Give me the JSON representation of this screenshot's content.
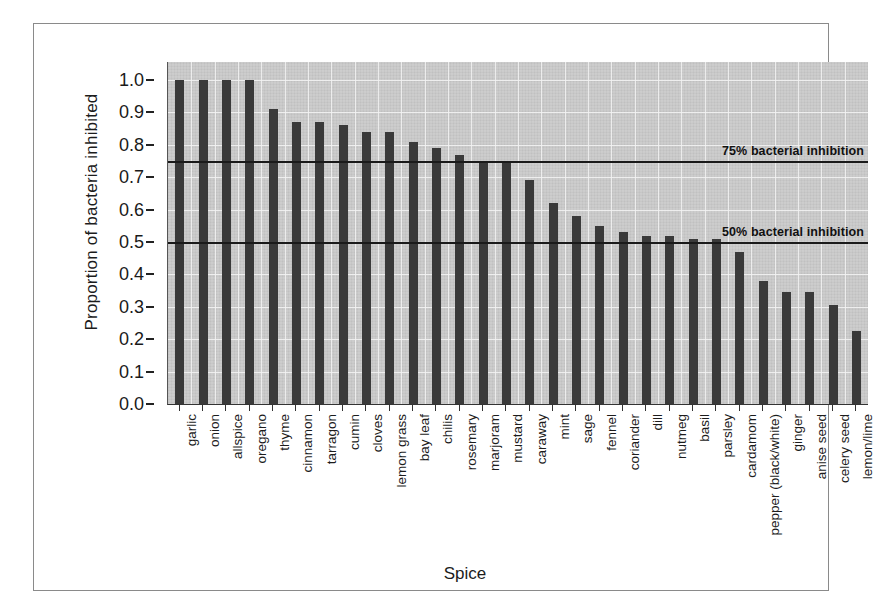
{
  "chart_data": {
    "type": "bar",
    "title": "",
    "xlabel": "Spice",
    "ylabel": "Proportion of bacteria inhibited",
    "ylim": [
      0.0,
      1.0
    ],
    "ytick_labels": [
      "1.0",
      "0.9",
      "0.8",
      "0.7",
      "0.6",
      "0.5",
      "0.4",
      "0.3",
      "0.2",
      "0.1",
      "0.0"
    ],
    "ytick_values": [
      1.0,
      0.9,
      0.8,
      0.7,
      0.6,
      0.5,
      0.4,
      0.3,
      0.2,
      0.1,
      0.0
    ],
    "grid": true,
    "legend": "none",
    "bar_color": "#3a3a3a",
    "panel_color": "#c9c9c9",
    "categories": [
      "garlic",
      "onion",
      "allspice",
      "oregano",
      "thyme",
      "cinnamon",
      "tarragon",
      "cumin",
      "cloves",
      "lemon grass",
      "bay leaf",
      "chilis",
      "rosemary",
      "marjoram",
      "mustard",
      "caraway",
      "mint",
      "sage",
      "fennel",
      "coriander",
      "dill",
      "nutmeg",
      "basil",
      "parsley",
      "cardamom",
      "pepper (black/white)",
      "ginger",
      "anise seed",
      "celery seed",
      "lemon/lime"
    ],
    "values": [
      1.0,
      1.0,
      1.0,
      1.0,
      0.91,
      0.87,
      0.87,
      0.86,
      0.84,
      0.84,
      0.81,
      0.79,
      0.77,
      0.75,
      0.75,
      0.69,
      0.62,
      0.58,
      0.55,
      0.53,
      0.52,
      0.52,
      0.51,
      0.51,
      0.47,
      0.38,
      0.345,
      0.345,
      0.305,
      0.225
    ],
    "annotations": [
      {
        "name": "75-percent-line",
        "value": 0.75,
        "label": "75% bacterial inhibition"
      },
      {
        "name": "50-percent-line",
        "value": 0.5,
        "label": "50% bacterial inhibition"
      }
    ]
  }
}
